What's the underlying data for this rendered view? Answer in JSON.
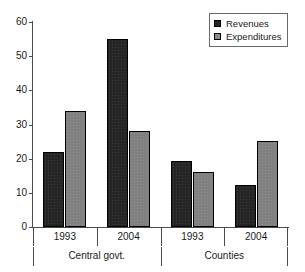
{
  "chart_data": {
    "type": "bar",
    "title": "",
    "subtitle": "",
    "xlabel": "",
    "ylabel": "",
    "ylim": [
      0,
      60
    ],
    "yticks": [
      0,
      10,
      20,
      30,
      40,
      50,
      60
    ],
    "grid": false,
    "legend_position": "top-right",
    "categories": [
      "1993",
      "2004",
      "1993",
      "2004"
    ],
    "group_labels": [
      "Central govt.",
      "Counties"
    ],
    "groups": [
      {
        "label": "Central govt.",
        "categories": [
          "1993",
          "2004"
        ]
      },
      {
        "label": "Counties",
        "categories": [
          "1993",
          "2004"
        ]
      }
    ],
    "series": [
      {
        "name": "Revenues",
        "color": "#252525",
        "values": [
          22,
          55,
          19.3,
          12.3
        ]
      },
      {
        "name": "Expenditures",
        "color": "#808080",
        "values": [
          34,
          28,
          16.2,
          25.3
        ]
      }
    ],
    "legend": [
      {
        "label": "Revenues",
        "swatch": "#252525"
      },
      {
        "label": "Expenditures",
        "swatch": "#8a8a8a"
      }
    ]
  },
  "axis": {
    "y_tick_labels": [
      "60",
      "50",
      "40",
      "30",
      "20",
      "10",
      "0"
    ]
  }
}
